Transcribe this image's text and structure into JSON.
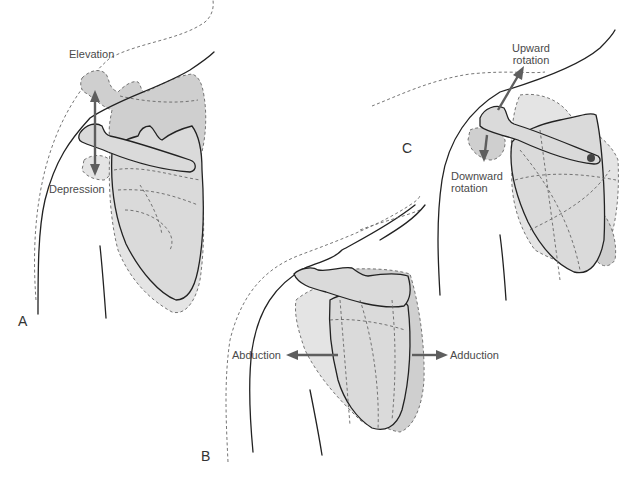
{
  "figure": {
    "panels": [
      {
        "id": "A",
        "label": "A",
        "movements": [
          "Elevation",
          "Depression"
        ]
      },
      {
        "id": "B",
        "label": "B",
        "movements": [
          "Abduction",
          "Adduction"
        ]
      },
      {
        "id": "C",
        "label": "C",
        "movements": [
          "Upward rotation",
          "Downward rotation"
        ]
      }
    ],
    "labels": {
      "elevation": "Elevation",
      "depression": "Depression",
      "abduction": "Abduction",
      "adduction": "Adduction",
      "upward_line1": "Upward",
      "upward_line2": "rotation",
      "downward_line1": "Downward",
      "downward_line2": "rotation"
    },
    "colors": {
      "arrow": "#5e5e5e",
      "bone_fill_light": "#e4e4e4",
      "bone_fill_mid": "#cfcfcf",
      "outline": "#222222",
      "dashed_outline": "#666666"
    }
  }
}
